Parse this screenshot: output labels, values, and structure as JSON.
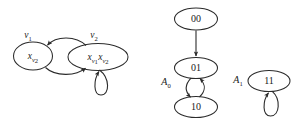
{
  "figure": {
    "background_color": "#ffffff",
    "stroke_color": "#2b2b2b",
    "text_color": "#1a1a1a"
  },
  "left_diagram": {
    "name": "variable-elimination-graph",
    "vertex_labels": [
      {
        "id": "v1",
        "base": "v",
        "sub": "1"
      },
      {
        "id": "v2",
        "base": "v",
        "sub": "2"
      }
    ],
    "nodes": [
      {
        "id": "node-xv2",
        "base": "x",
        "sub": "v",
        "subsub": "2",
        "vertex_label": "v1"
      },
      {
        "id": "node-xv1xv2",
        "base1": "x",
        "sub1": "v",
        "subsub1": "1",
        "base2": "x",
        "sub2": "v",
        "subsub2": "2",
        "vertex_label": "v2"
      }
    ],
    "edges": [
      {
        "from": "node-xv1xv2",
        "to": "node-xv2",
        "style": "curved-top"
      },
      {
        "from": "node-xv2",
        "to": "node-xv1xv2",
        "style": "curved-bottom"
      },
      {
        "from": "node-xv1xv2",
        "to": "node-xv1xv2",
        "style": "self-loop-below"
      }
    ]
  },
  "right_diagram": {
    "name": "binary-state-automaton",
    "set_labels": [
      {
        "id": "A0",
        "base": "A",
        "sub": "0"
      },
      {
        "id": "A1",
        "base": "A",
        "sub": "1"
      }
    ],
    "nodes": [
      {
        "id": "node-00",
        "label": "00"
      },
      {
        "id": "node-01",
        "label": "01"
      },
      {
        "id": "node-10",
        "label": "10"
      },
      {
        "id": "node-11",
        "label": "11"
      }
    ],
    "edges": [
      {
        "from": "node-00",
        "to": "node-01",
        "style": "straight-down"
      },
      {
        "from": "node-01",
        "to": "node-10",
        "style": "curved-left"
      },
      {
        "from": "node-10",
        "to": "node-01",
        "style": "curved-right"
      },
      {
        "from": "node-11",
        "to": "node-11",
        "style": "self-loop-below"
      }
    ]
  }
}
